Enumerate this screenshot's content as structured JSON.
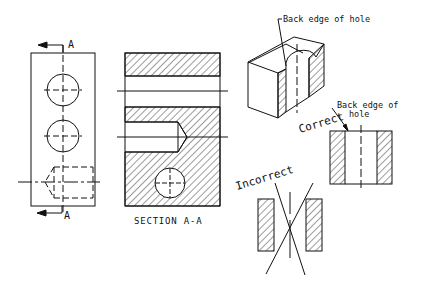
{
  "figure": {
    "front_view": {
      "section_label_top": "A",
      "section_label_bottom": "A"
    },
    "section_view": {
      "caption": "SECTION A-A"
    },
    "isometric_view": {
      "callout": "Back edge of hole"
    },
    "correct_view": {
      "label": "Correct",
      "callout_line1": "Back edge of",
      "callout_line2": "hole"
    },
    "incorrect_view": {
      "label": "Incorrect"
    }
  },
  "colors": {
    "line": "#111111",
    "background": "#ffffff"
  }
}
